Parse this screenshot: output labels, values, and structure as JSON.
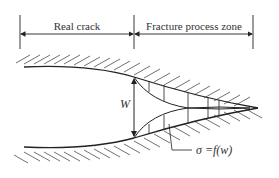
{
  "diagram": {
    "labels": {
      "real_crack": "Real crack",
      "fracture_process_zone": "Fracture process zone",
      "opening": "W",
      "stress_relation": "σ =f(w)"
    },
    "colors": {
      "line": "#222222",
      "text": "#333333",
      "background": "#ffffff"
    }
  }
}
